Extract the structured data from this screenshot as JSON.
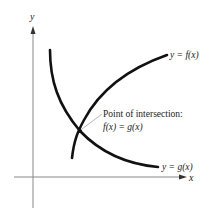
{
  "diagram": {
    "axes": {
      "y_label": "y",
      "x_label": "x"
    },
    "curves": {
      "f": {
        "label": "y = f(x)"
      },
      "g": {
        "label": "y = g(x)"
      }
    },
    "annotation": {
      "line1": "Point of intersection:",
      "line2": "f(x) = g(x)"
    },
    "colors": {
      "curve": "#111111",
      "axis": "#777777",
      "leader": "#999999",
      "text": "#222222"
    }
  }
}
